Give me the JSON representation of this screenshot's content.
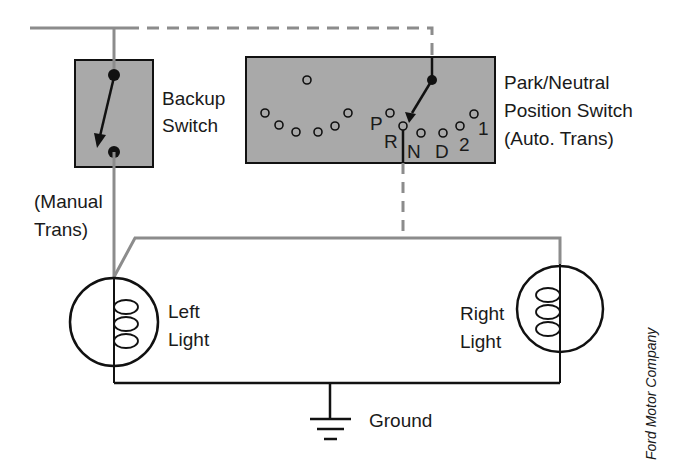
{
  "diagram": {
    "type": "wiring-schematic",
    "colors": {
      "switch_box_fill": "#a9a9a9",
      "wire_gray": "#8c8c8c",
      "wire_black": "#111111",
      "background": "#ffffff"
    },
    "components": {
      "backup_switch": {
        "label_line1": "Backup",
        "label_line2": "Switch",
        "note_line1": "(Manual",
        "note_line2": "Trans)"
      },
      "park_neutral_switch": {
        "label_line1": "Park/Neutral",
        "label_line2": "Position Switch",
        "label_line3": "(Auto. Trans)",
        "positions": [
          "P",
          "R",
          "N",
          "D",
          "2",
          "1"
        ]
      },
      "left_light": {
        "label_line1": "Left",
        "label_line2": "Light"
      },
      "right_light": {
        "label_line1": "Right",
        "label_line2": "Light"
      },
      "ground": {
        "label": "Ground"
      }
    },
    "credit": "Ford Motor Company"
  }
}
